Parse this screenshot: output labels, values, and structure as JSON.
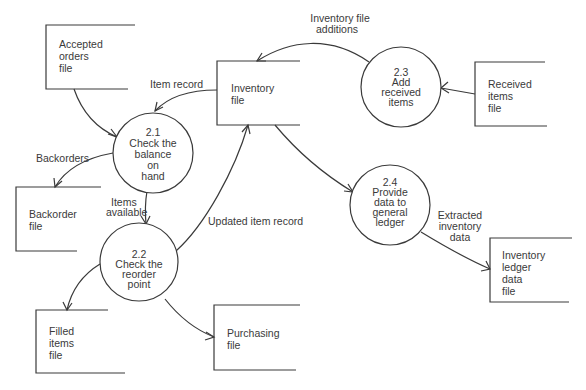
{
  "diagram": {
    "type": "data-flow-diagram",
    "data_stores": [
      {
        "id": "accepted_orders",
        "lines": [
          "Accepted",
          "orders",
          "file"
        ]
      },
      {
        "id": "inventory",
        "lines": [
          "Inventory",
          "file"
        ]
      },
      {
        "id": "received_items",
        "lines": [
          "Received",
          "items",
          "file"
        ]
      },
      {
        "id": "backorder",
        "lines": [
          "Backorder",
          "file"
        ]
      },
      {
        "id": "filled_items",
        "lines": [
          "Filled",
          "items",
          "file"
        ]
      },
      {
        "id": "purchasing",
        "lines": [
          "Purchasing",
          "file"
        ]
      },
      {
        "id": "inventory_ledger",
        "lines": [
          "Inventory",
          "ledger",
          "data",
          "file"
        ]
      }
    ],
    "processes": [
      {
        "id": "p21",
        "lines": [
          "2.1",
          "Check the",
          "balance",
          "on",
          "hand"
        ]
      },
      {
        "id": "p22",
        "lines": [
          "2.2",
          "Check the",
          "reorder",
          "point"
        ]
      },
      {
        "id": "p23",
        "lines": [
          "2.3",
          "Add",
          "received",
          "items"
        ]
      },
      {
        "id": "p24",
        "lines": [
          "2.4",
          "Provide",
          "data to",
          "general",
          "ledger"
        ]
      }
    ],
    "flows": [
      {
        "from": "accepted_orders",
        "to": "p21",
        "lines": []
      },
      {
        "from": "inventory",
        "to": "p21",
        "lines": [
          "Item record"
        ]
      },
      {
        "from": "p21",
        "to": "backorder",
        "lines": [
          "Backorders"
        ]
      },
      {
        "from": "p21",
        "to": "p22",
        "lines": [
          "Items",
          "available"
        ]
      },
      {
        "from": "p22",
        "to": "inventory",
        "lines": [
          "Updated item record"
        ]
      },
      {
        "from": "p22",
        "to": "filled_items",
        "lines": []
      },
      {
        "from": "p22",
        "to": "purchasing",
        "lines": []
      },
      {
        "from": "p23",
        "to": "inventory",
        "lines": [
          "Inventory file",
          "additions"
        ]
      },
      {
        "from": "received_items",
        "to": "p23",
        "lines": []
      },
      {
        "from": "inventory",
        "to": "p24",
        "lines": []
      },
      {
        "from": "p24",
        "to": "inventory_ledger",
        "lines": [
          "Extracted",
          "inventory",
          "data"
        ]
      }
    ]
  }
}
